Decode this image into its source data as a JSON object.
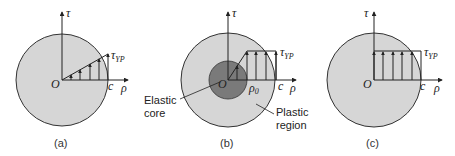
{
  "colors": {
    "disk_fill": "#d6d6d6",
    "core_fill": "#7a7a7a",
    "outline": "#333333",
    "axis": "#222222"
  },
  "panels": [
    {
      "caption": "(a)",
      "axis_vertical": "τ",
      "axis_horizontal": "ρ",
      "origin": "O",
      "radius_label": "c",
      "stress_label": "τ",
      "stress_sub": "YP",
      "distribution": "linear"
    },
    {
      "caption": "(b)",
      "axis_vertical": "τ",
      "axis_horizontal": "ρ",
      "origin": "O",
      "radius_label": "c",
      "core_radius_label": "ρ",
      "core_radius_sub": "0",
      "stress_label": "τ",
      "stress_sub": "YP",
      "distribution": "elastic-plastic",
      "callout_core_line1": "Elastic",
      "callout_core_line2": "core",
      "callout_region_line1": "Plastic",
      "callout_region_line2": "region"
    },
    {
      "caption": "(c)",
      "axis_vertical": "τ",
      "axis_horizontal": "ρ",
      "origin": "O",
      "radius_label": "c",
      "stress_label": "τ",
      "stress_sub": "YP",
      "distribution": "fully-plastic"
    }
  ]
}
